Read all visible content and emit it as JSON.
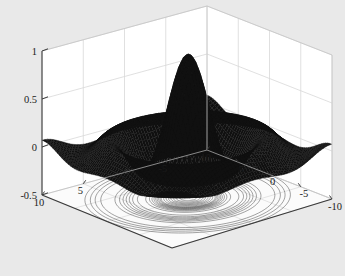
{
  "figure": {
    "kind": "matlab-3d-surface-plot",
    "background_color": "#e9e9e9",
    "wall_color": "#ffffff",
    "floor_color": "#fbfbfb",
    "grid_color": "#d8d8d8",
    "axis_line_color": "#3a3a3a",
    "surface_color": "#101010",
    "contour_color": "#4a4a4a"
  },
  "chart_data": {
    "type": "surface",
    "title": "",
    "subtitle": "",
    "xlabel": "",
    "ylabel": "",
    "zlabel": "",
    "grid": true,
    "legend": "none",
    "function": "sinc / sombrero: z = sin(r)/r, r = sqrt(x^2 + y^2)",
    "overlay": "filled contour lines projected on the floor plane (meshc style)",
    "xlim": [
      -10,
      10
    ],
    "ylim": [
      -10,
      10
    ],
    "zlim": [
      -0.5,
      1
    ],
    "x_ticks": [
      -10,
      -5,
      0,
      5
    ],
    "x_tick_labels": [
      "-10",
      "-5",
      "0",
      "5"
    ],
    "y_ticks": [
      10,
      5,
      0,
      -5,
      -10
    ],
    "y_tick_labels": [
      "10",
      "5",
      "0",
      "-5",
      "-10"
    ],
    "z_ticks": [
      1,
      0.5,
      0,
      -0.5
    ],
    "z_tick_labels": [
      "1",
      "0.5",
      "0",
      "-0.5"
    ],
    "peak_value": 1.0,
    "min_value": -0.22,
    "mesh_n": 60,
    "view_azimuth": -37.5,
    "view_elevation": 30,
    "contour_levels": [
      -0.2,
      -0.15,
      -0.1,
      -0.05,
      0,
      0.05,
      0.1,
      0.15,
      0.2,
      0.3,
      0.4,
      0.5,
      0.6,
      0.7,
      0.8,
      0.9
    ]
  }
}
